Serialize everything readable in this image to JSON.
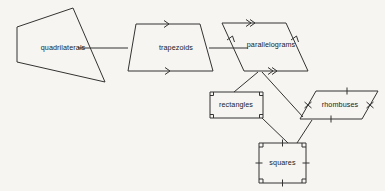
{
  "diagram": {
    "background_color": "#f6f5f1",
    "line_color": "#333333",
    "text_color": "#1a1a1a",
    "nodes": [
      {
        "id": "quadrilaterals",
        "label": "quadrilaterals",
        "shape": "irregular-quadrilateral",
        "label_x": 63,
        "label_y": 48,
        "points": "17,27 73,8 105,82 17,62",
        "congruence_marks": []
      },
      {
        "id": "trapezoids",
        "label": "trapezoids",
        "shape": "trapezoid",
        "label_x": 176,
        "label_y": 48,
        "points": "136,24 200,24 213,71 128,71",
        "congruence_marks": [
          "single-arrow-top",
          "single-arrow-bottom"
        ]
      },
      {
        "id": "parallelograms",
        "label": "parallelograms",
        "shape": "parallelogram",
        "label_x": 271,
        "label_y": 45,
        "points": "222,23 286,23 308,71 244,71",
        "congruence_marks": [
          "double-arrow-top",
          "double-arrow-bottom",
          "single-arrow-left",
          "single-arrow-right"
        ]
      },
      {
        "id": "rectangles",
        "label": "rectangles",
        "shape": "rectangle",
        "label_x": 236,
        "label_y": 105,
        "points": "210,92 263,92 263,118 210,118",
        "congruence_marks": [
          "right-angle-corners"
        ]
      },
      {
        "id": "rhombuses",
        "label": "rhombuses",
        "shape": "rhombus",
        "label_x": 340,
        "label_y": 105,
        "points": "316,91 378,91 362,119 300,119",
        "congruence_marks": [
          "tick-all-sides"
        ]
      },
      {
        "id": "squares",
        "label": "squares",
        "shape": "square",
        "label_x": 282,
        "label_y": 163,
        "points": "259,143 306,143 306,183 259,183",
        "congruence_marks": [
          "right-angle-corners",
          "tick-all-sides"
        ]
      }
    ],
    "connectors": [
      {
        "id": "quad-to-trap",
        "from": "quadrilaterals",
        "to": "trapezoids",
        "path": "M 78 48 L 128 48"
      },
      {
        "id": "trap-to-para",
        "from": "trapezoids",
        "to": "parallelograms",
        "path": "M 209 48 L 248 48"
      },
      {
        "id": "para-to-rect",
        "from": "parallelograms",
        "to": "rectangles",
        "path": "M 258 72 L 234 92"
      },
      {
        "id": "para-to-rhom",
        "from": "parallelograms",
        "to": "rhombuses",
        "path": "M 262 72 L 303 117"
      },
      {
        "id": "rect-to-sq",
        "from": "rectangles",
        "to": "squares",
        "path": "M 262 118 L 288 143"
      },
      {
        "id": "rhom-to-sq",
        "from": "rhombuses",
        "to": "squares",
        "path": "M 312 120 L 297 143"
      }
    ]
  }
}
